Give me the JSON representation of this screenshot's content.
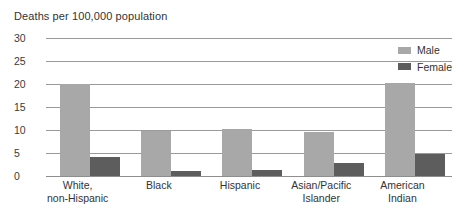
{
  "chart_data": {
    "type": "bar",
    "title": "Deaths per 100,000 population",
    "xlabel": "",
    "ylabel": "",
    "ylim": [
      0,
      30
    ],
    "yticks": [
      0,
      5,
      10,
      15,
      20,
      25,
      30
    ],
    "grid": true,
    "legend_position": "top-right",
    "categories": [
      "White, non-Hispanic",
      "Black",
      "Hispanic",
      "Asian/Pacific Islander",
      "American Indian"
    ],
    "category_lines": [
      [
        "White,",
        "non-Hispanic"
      ],
      [
        "Black",
        ""
      ],
      [
        "Hispanic",
        ""
      ],
      [
        "Asian/Pacific",
        "Islander"
      ],
      [
        "American",
        "Indian"
      ]
    ],
    "series": [
      {
        "name": "Male",
        "color": "#a8a8a8",
        "values": [
          20.0,
          9.8,
          10.2,
          9.6,
          20.3
        ]
      },
      {
        "name": "Female",
        "color": "#5d5d5d",
        "values": [
          4.2,
          1.1,
          1.4,
          2.9,
          4.8
        ]
      }
    ]
  },
  "colors": {
    "male": "#a8a8a8",
    "female": "#5d5d5d",
    "gridline": "#9a9a9a",
    "text": "#333333",
    "background": "#ffffff"
  }
}
